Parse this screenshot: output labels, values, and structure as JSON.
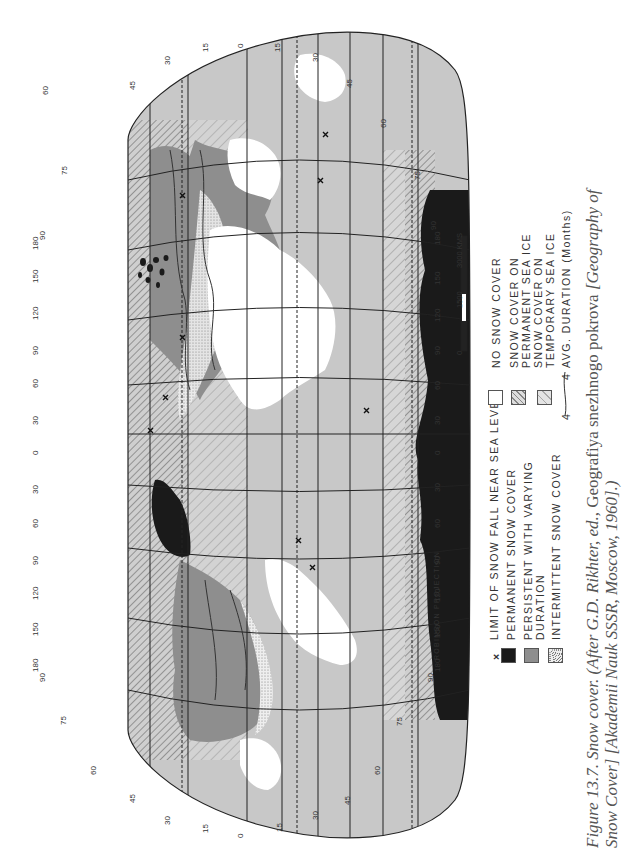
{
  "figure": {
    "projection_label": "ROBINSON PROJECTION",
    "orientation": "rotated 90° counterclockwise (north at left)",
    "caption": {
      "number": "Figure 13.7.",
      "title": "Snow cover.",
      "source_line1_italic": "(After G.D. Rikhter, ed.,",
      "source_line1_roman": "Geografiya snezhnogo pokrova",
      "source_line1_tail": "[Geography of",
      "source_line2": "Snow Cover] [Akademii Nauk SSSR, Moscow, 1960].)"
    }
  },
  "legend": {
    "left_column": [
      {
        "symbol": "x-mark",
        "label": "LIMIT OF SNOW FALL NEAR SEA LEVEL"
      },
      {
        "symbol": "solid-black",
        "label": "PERMANENT SNOW COVER"
      },
      {
        "symbol": "solid-gray",
        "label_line1": "PERSISTENT WITH VARYING",
        "label_line2": "DURATION"
      },
      {
        "symbol": "stippled",
        "label": "INTERMITTENT SNOW COVER"
      }
    ],
    "right_column": [
      {
        "symbol": "empty",
        "label": "NO SNOW COVER"
      },
      {
        "symbol": "dense-hatch",
        "label_line1": "SNOW COVER ON",
        "label_line2": "PERMANENT SEA ICE"
      },
      {
        "symbol": "sparse-hatch",
        "label_line1": "SNOW COVER ON",
        "label_line2": "TEMPORARY SEA ICE"
      },
      {
        "symbol": "isoline",
        "isoline_value": "4",
        "label_value": "4",
        "label": "AVG. DURATION (Months)"
      }
    ]
  },
  "scale_bar": {
    "labels": [
      "0",
      "1500",
      "3000 KMS"
    ]
  },
  "graticule": {
    "latitude_labels_north_edge": [
      "90",
      "75",
      "60",
      "45",
      "30",
      "15",
      "0",
      "15",
      "30",
      "45",
      "60",
      "75",
      "90"
    ],
    "longitude_labels_top": [
      "180",
      "150",
      "120",
      "90",
      "60",
      "30",
      "0",
      "30",
      "60",
      "90",
      "120",
      "150",
      "180"
    ],
    "longitude_labels_bottom": [
      "180",
      "150",
      "120",
      "90",
      "60",
      "30",
      "0",
      "30",
      "60",
      "90",
      "120",
      "150",
      "180"
    ],
    "isoline_values": [
      "0",
      "2",
      "4",
      "6",
      "8"
    ]
  },
  "colors": {
    "ocean": "#c8c8c8",
    "land_no_snow": "#ffffff",
    "persistent": "#8e8e8e",
    "permanent": "#1a1a1a",
    "grid": "#222222",
    "text": "#333333",
    "caption": "#555555"
  }
}
